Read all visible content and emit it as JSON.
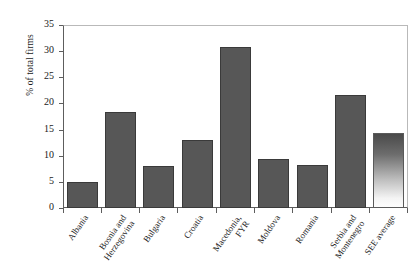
{
  "chart_data": {
    "type": "bar",
    "title": "",
    "subtitle": "",
    "xlabel": "",
    "ylabel": "% of total firms",
    "ylim": [
      0,
      35
    ],
    "ytick_values": [
      35,
      30,
      25,
      20,
      15,
      10,
      5,
      0
    ],
    "ytick_labels": [
      "35",
      "30",
      "25",
      "20",
      "15",
      "10",
      "5",
      "0"
    ],
    "grid": false,
    "legend": null,
    "categories": [
      "Albania",
      "Bosnia and Herzegovina",
      "Bulgaria",
      "Croatia",
      "Macedonia, FYR",
      "Moldova",
      "Romania",
      "Serbia and Montenegro",
      "SEE average"
    ],
    "category_lines": [
      [
        "Albania"
      ],
      [
        "Bosnia and",
        "Herzegovina"
      ],
      [
        "Bulgaria"
      ],
      [
        "Croatia"
      ],
      [
        "Macedonia,",
        "FYR"
      ],
      [
        "Moldova"
      ],
      [
        "Romania"
      ],
      [
        "Serbia and",
        "Montenegro"
      ],
      [
        "SEE average"
      ]
    ],
    "values": [
      4.9,
      18.3,
      8.1,
      13.1,
      30.7,
      9.3,
      8.3,
      21.6,
      14.4
    ],
    "bar_styles": [
      "solid",
      "solid",
      "solid",
      "solid",
      "solid",
      "solid",
      "solid",
      "solid",
      "gradient"
    ],
    "colors": {
      "bar_fill": "#575757",
      "bar_stroke": "#3a3a3a",
      "gradient_top": "#4a4a4a",
      "gradient_bottom": "#fdfdfd",
      "axis": "#5d5d5d",
      "frame": "#b9b9b9",
      "background": "#ffffff",
      "text": "#1a1a1a"
    }
  }
}
